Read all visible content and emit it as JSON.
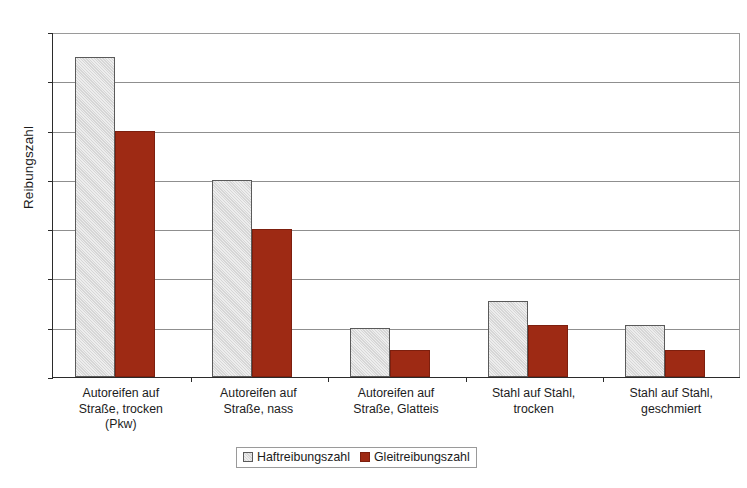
{
  "chart_data": {
    "type": "bar",
    "title": "",
    "xlabel": "",
    "ylabel": "Reibungszahl",
    "ylim": [
      0,
      0.7
    ],
    "grid": true,
    "legend_position": "bottom",
    "categories": [
      "Autoreifen auf\nStraße, trocken\n(Pkw)",
      "Autoreifen auf\nStraße, nass",
      "Autoreifen auf\nStraße, Glatteis",
      "Stahl auf Stahl,\ntrocken",
      "Stahl auf Stahl,\ngeschmiert"
    ],
    "series": [
      {
        "name": "Haftreibungszahl",
        "color": "#d6d6d6",
        "values": [
          0.65,
          0.4,
          0.1,
          0.155,
          0.105
        ]
      },
      {
        "name": "Gleitreibungszahl",
        "color": "#9e2a14",
        "values": [
          0.5,
          0.3,
          0.055,
          0.105,
          0.055
        ]
      }
    ],
    "y_ticks": [
      {
        "value": 0.7,
        "label": "0,7"
      },
      {
        "value": 0.6,
        "label": "0,6"
      },
      {
        "value": 0.5,
        "label": "0,5"
      },
      {
        "value": 0.4,
        "label": "0,4"
      },
      {
        "value": 0.3,
        "label": "0,3"
      },
      {
        "value": 0.2,
        "label": "0,2"
      },
      {
        "value": 0.1,
        "label": "0,1"
      },
      {
        "value": 0.0,
        "label": "0"
      }
    ]
  },
  "axis": {
    "y_title": "Reibungszahl"
  },
  "categories": {
    "c0_line1": "Autoreifen auf",
    "c0_line2": "Straße, trocken",
    "c0_line3": "(Pkw)",
    "c1_line1": "Autoreifen auf",
    "c1_line2": "Straße, nass",
    "c2_line1": "Autoreifen auf",
    "c2_line2": "Straße, Glatteis",
    "c3_line1": "Stahl auf Stahl,",
    "c3_line2": "trocken",
    "c4_line1": "Stahl auf Stahl,",
    "c4_line2": "geschmiert"
  },
  "legend": {
    "items": [
      {
        "label": "Haftreibungszahl",
        "color": "#d6d6d6"
      },
      {
        "label": "Gleitreibungszahl",
        "color": "#9e2a14"
      }
    ]
  }
}
